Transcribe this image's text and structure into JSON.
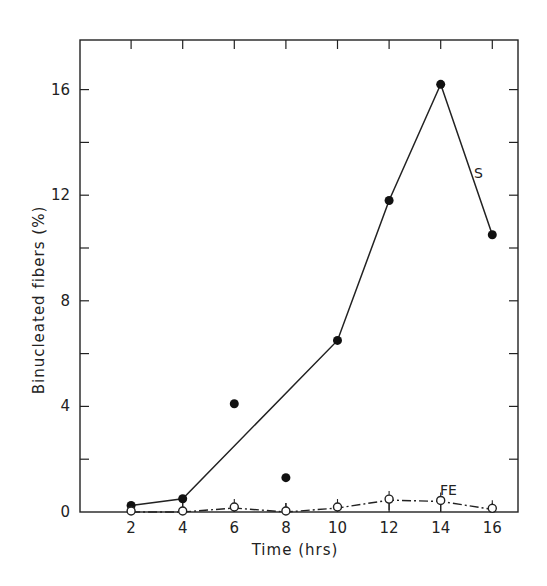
{
  "chart_data": {
    "type": "line",
    "title": "",
    "xlabel": "Time (hrs)",
    "ylabel": "Binucleated fibers (%)",
    "xlim": [
      0,
      17
    ],
    "ylim": [
      0,
      18
    ],
    "x_ticks": [
      2,
      4,
      6,
      8,
      10,
      12,
      14,
      16
    ],
    "x_tick_labels": [
      "2",
      "4",
      "6",
      "8",
      "10",
      "12",
      "14",
      "16"
    ],
    "y_ticks": [
      0,
      4,
      8,
      12,
      16
    ],
    "y_tick_labels": [
      "0",
      "4",
      "8",
      "12",
      "16"
    ],
    "y_minor_ticks": [
      2,
      6,
      10,
      14
    ],
    "grid": false,
    "legend": "inline labels next to series",
    "series": [
      {
        "name": "S",
        "marker": "filled-circle",
        "line": "solid",
        "points": [
          {
            "x": 2,
            "y": 0.25,
            "connected": true
          },
          {
            "x": 4,
            "y": 0.5,
            "connected": true
          },
          {
            "x": 6,
            "y": 4.1,
            "connected": false
          },
          {
            "x": 8,
            "y": 1.3,
            "connected": false
          },
          {
            "x": 10,
            "y": 6.5,
            "connected": true
          },
          {
            "x": 12,
            "y": 11.8,
            "connected": true
          },
          {
            "x": 14,
            "y": 16.2,
            "connected": true
          },
          {
            "x": 16,
            "y": 10.5,
            "connected": true
          }
        ]
      },
      {
        "name": "FE",
        "marker": "open-circle",
        "line": "dash-dot",
        "error_bars": true,
        "points": [
          {
            "x": 2,
            "y": 0.0
          },
          {
            "x": 4,
            "y": 0.0
          },
          {
            "x": 6,
            "y": 0.15
          },
          {
            "x": 8,
            "y": 0.0
          },
          {
            "x": 10,
            "y": 0.15
          },
          {
            "x": 12,
            "y": 0.45
          },
          {
            "x": 14,
            "y": 0.4
          },
          {
            "x": 16,
            "y": 0.1
          }
        ]
      }
    ]
  },
  "labels": {
    "xlabel": "Time (hrs)",
    "ylabel": "Binucleated fibers (%)",
    "series_s": "S",
    "series_fe": "FE"
  }
}
